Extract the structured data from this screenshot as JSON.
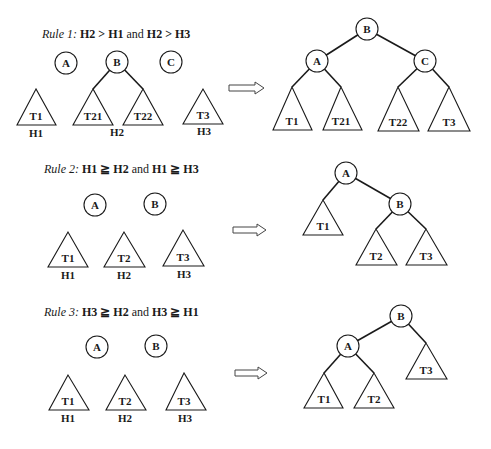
{
  "rules": [
    {
      "title": {
        "prefix": "Rule 1:",
        "cond1": "H2 > H1",
        "and": "and",
        "cond2": "H2 > H3"
      },
      "before": {
        "nodes": [
          {
            "label": "A",
            "x": 66,
            "y": 63
          },
          {
            "label": "B",
            "x": 117,
            "y": 62
          },
          {
            "label": "C",
            "x": 171,
            "y": 62
          }
        ],
        "edges": [
          [
            117,
            62,
            93,
            89
          ],
          [
            117,
            62,
            143,
            89
          ]
        ],
        "subtrees": [
          {
            "label": "T1",
            "apex": [
              36,
              89
            ],
            "base": [
              17,
              56,
              125
            ]
          },
          {
            "label": "T21",
            "apex": [
              93,
              89
            ],
            "base": [
              73,
              113,
              125
            ]
          },
          {
            "label": "T22",
            "apex": [
              143,
              89
            ],
            "base": [
              123,
              163,
              125
            ]
          },
          {
            "label": "T3",
            "apex": [
              203,
              89
            ],
            "base": [
              183,
              223,
              124
            ]
          }
        ],
        "heights": [
          {
            "label": "H1",
            "x": 36,
            "y": 137
          },
          {
            "label": "H2",
            "x": 117,
            "y": 136
          },
          {
            "label": "H3",
            "x": 204,
            "y": 135
          }
        ]
      },
      "arrow": {
        "x1": 229,
        "x2": 264,
        "y": 88
      },
      "after": {
        "nodes": [
          {
            "label": "B",
            "x": 367,
            "y": 29
          },
          {
            "label": "A",
            "x": 317,
            "y": 61
          },
          {
            "label": "C",
            "x": 425,
            "y": 61
          }
        ],
        "edges": [
          [
            367,
            29,
            317,
            61
          ],
          [
            367,
            29,
            425,
            61
          ],
          [
            317,
            61,
            292,
            87
          ],
          [
            317,
            61,
            341,
            87
          ],
          [
            425,
            61,
            398,
            87
          ],
          [
            425,
            61,
            449,
            87
          ]
        ],
        "subtrees": [
          {
            "label": "T1",
            "apex": [
              292,
              87
            ],
            "base": [
              273,
              312,
              130
            ]
          },
          {
            "label": "T21",
            "apex": [
              341,
              87
            ],
            "base": [
              323,
              362,
              130
            ]
          },
          {
            "label": "T22",
            "apex": [
              398,
              87
            ],
            "base": [
              378,
              419,
              131
            ]
          },
          {
            "label": "T3",
            "apex": [
              449,
              87
            ],
            "base": [
              428,
              470,
              131
            ]
          }
        ]
      },
      "title_pos": {
        "x": 42,
        "y": 38
      }
    },
    {
      "title": {
        "prefix": "Rule 2:",
        "cond1": "H1 ≧ H2",
        "and": "and",
        "cond2": "H1 ≧ H3"
      },
      "before": {
        "nodes": [
          {
            "label": "A",
            "x": 95,
            "y": 205
          },
          {
            "label": "B",
            "x": 155,
            "y": 204
          }
        ],
        "edges": [],
        "subtrees": [
          {
            "label": "T1",
            "apex": [
              68,
              232
            ],
            "base": [
              48,
              88,
              267
            ]
          },
          {
            "label": "T2",
            "apex": [
              124,
              232
            ],
            "base": [
              104,
              145,
              267
            ]
          },
          {
            "label": "T3",
            "apex": [
              183,
              230
            ],
            "base": [
              163,
              204,
              266
            ]
          }
        ],
        "heights": [
          {
            "label": "H1",
            "x": 68,
            "y": 279
          },
          {
            "label": "H2",
            "x": 124,
            "y": 279
          },
          {
            "label": "H3",
            "x": 184,
            "y": 278
          }
        ]
      },
      "arrow": {
        "x1": 233,
        "x2": 266,
        "y": 230
      },
      "after": {
        "nodes": [
          {
            "label": "A",
            "x": 346,
            "y": 173
          },
          {
            "label": "B",
            "x": 400,
            "y": 204
          }
        ],
        "edges": [
          [
            346,
            173,
            323,
            200
          ],
          [
            346,
            173,
            400,
            204
          ],
          [
            400,
            204,
            376,
            229
          ],
          [
            400,
            204,
            426,
            229
          ]
        ],
        "subtrees": [
          {
            "label": "T1",
            "apex": [
              323,
              200
            ],
            "base": [
              303,
              343,
              235
            ]
          },
          {
            "label": "T2",
            "apex": [
              376,
              229
            ],
            "base": [
              356,
              397,
              265
            ]
          },
          {
            "label": "T3",
            "apex": [
              426,
              229
            ],
            "base": [
              406,
              447,
              265
            ]
          }
        ]
      },
      "title_pos": {
        "x": 44,
        "y": 173
      }
    },
    {
      "title": {
        "prefix": "Rule 3:",
        "cond1": "H3 ≧ H2",
        "and": "and",
        "cond2": "H3 ≧ H1"
      },
      "before": {
        "nodes": [
          {
            "label": "A",
            "x": 97,
            "y": 347
          },
          {
            "label": "B",
            "x": 156,
            "y": 346
          }
        ],
        "edges": [],
        "subtrees": [
          {
            "label": "T1",
            "apex": [
              68,
              375
            ],
            "base": [
              49,
              89,
              410
            ]
          },
          {
            "label": "T2",
            "apex": [
              125,
              375
            ],
            "base": [
              106,
              146,
              410
            ]
          },
          {
            "label": "T3",
            "apex": [
              184,
              373
            ],
            "base": [
              166,
              206,
              410
            ]
          }
        ],
        "heights": [
          {
            "label": "H1",
            "x": 68,
            "y": 422
          },
          {
            "label": "H2",
            "x": 125,
            "y": 422
          },
          {
            "label": "H3",
            "x": 185,
            "y": 422
          }
        ]
      },
      "arrow": {
        "x1": 235,
        "x2": 267,
        "y": 373
      },
      "after": {
        "nodes": [
          {
            "label": "B",
            "x": 401,
            "y": 316
          },
          {
            "label": "A",
            "x": 348,
            "y": 346
          }
        ],
        "edges": [
          [
            401,
            316,
            348,
            346
          ],
          [
            401,
            316,
            426,
            343
          ],
          [
            348,
            346,
            324,
            373
          ],
          [
            348,
            346,
            374,
            373
          ]
        ],
        "subtrees": [
          {
            "label": "T1",
            "apex": [
              324,
              373
            ],
            "base": [
              304,
              343,
              408
            ]
          },
          {
            "label": "T2",
            "apex": [
              374,
              373
            ],
            "base": [
              354,
              394,
              408
            ]
          },
          {
            "label": "T3",
            "apex": [
              426,
              343
            ],
            "base": [
              406,
              447,
              379
            ]
          }
        ]
      },
      "title_pos": {
        "x": 44,
        "y": 316
      }
    }
  ]
}
